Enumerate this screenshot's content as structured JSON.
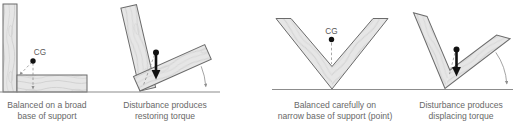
{
  "figure": {
    "background_color": "#ffffff",
    "colors": {
      "wood_fill": "#e6e6e6",
      "wood_grain": "#cfcfcf",
      "wood_outline": "#6b6b6b",
      "ground_line": "#8c8c8c",
      "annotation_gray": "#909090",
      "force_arrow": "#111111",
      "caption_text": "#686868"
    },
    "panels": [
      {
        "id": "broad-base-balanced",
        "cg_label": "CG",
        "caption_line1": "Balanced on a broad",
        "caption_line2": "base of support"
      },
      {
        "id": "broad-base-disturbed",
        "caption_line1": "Disturbance produces",
        "caption_line2": "restoring torque"
      },
      {
        "id": "point-base-balanced",
        "cg_label": "CG",
        "caption_line1": "Balanced carefully on",
        "caption_line2": "narrow base of support (point)"
      },
      {
        "id": "point-base-disturbed",
        "caption_line1": "Disturbance produces",
        "caption_line2": "displacing torque"
      }
    ]
  }
}
